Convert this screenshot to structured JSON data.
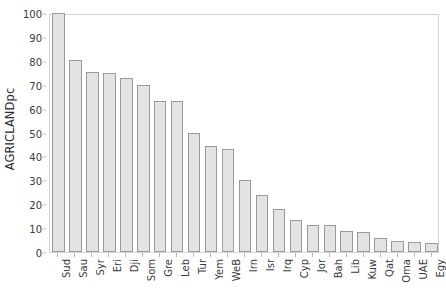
{
  "chart_data": {
    "type": "bar",
    "title": "",
    "subtitle": "",
    "xlabel": "",
    "ylabel": "AGRICLANDpc",
    "ylim": [
      0,
      100
    ],
    "ytick_step": 10,
    "yticks": [
      0,
      10,
      20,
      30,
      40,
      50,
      60,
      70,
      80,
      90,
      100
    ],
    "grid": false,
    "legend": null,
    "orientation": "vertical",
    "sorted": "descending",
    "categories": [
      "Sud",
      "Sau",
      "Syr",
      "Eri",
      "Dji",
      "Som",
      "Gre",
      "Leb",
      "Tur",
      "Yem",
      "WeB",
      "Irn",
      "Isr",
      "Irq",
      "Cyp",
      "Jor",
      "Bah",
      "Lib",
      "Kuw",
      "Qat",
      "Oma",
      "UAE",
      "Egy"
    ],
    "values": [
      100.0,
      80.5,
      75.5,
      75.0,
      73.0,
      70.0,
      63.0,
      63.0,
      50.0,
      44.5,
      43.0,
      30.0,
      24.0,
      18.0,
      13.3,
      11.3,
      11.3,
      9.0,
      8.5,
      5.7,
      4.7,
      4.0,
      3.6
    ],
    "series": [
      {
        "name": "AGRICLANDpc",
        "values": [
          100.0,
          80.5,
          75.5,
          75.0,
          73.0,
          70.0,
          63.0,
          63.0,
          50.0,
          44.5,
          43.0,
          30.0,
          24.0,
          18.0,
          13.3,
          11.3,
          11.3,
          9.0,
          8.5,
          5.7,
          4.7,
          4.0,
          3.6
        ]
      }
    ]
  },
  "style": {
    "bar_fill": "#e3e3e3",
    "bar_stroke": "#9a9a9a",
    "frame_stroke": "#d5d5d5",
    "text_color": "#3a3a3a",
    "background": "#ffffff"
  }
}
